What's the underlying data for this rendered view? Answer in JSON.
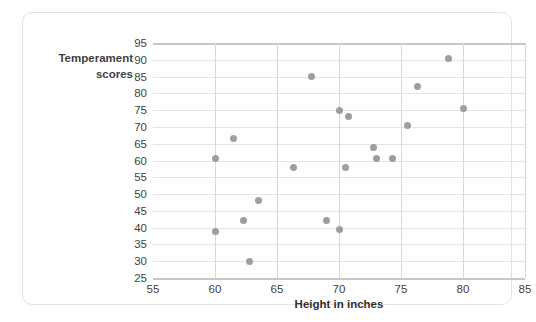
{
  "chart_data": {
    "type": "scatter",
    "title": "",
    "xlabel": "Height in inches",
    "ylabel": "Temperament scores",
    "ylabel_line1": "Temperament",
    "ylabel_line2": "scores",
    "xlim": [
      55,
      85
    ],
    "ylim": [
      25,
      95
    ],
    "xticks": [
      55,
      60,
      65,
      70,
      75,
      80,
      85
    ],
    "yticks": [
      25,
      30,
      35,
      40,
      45,
      50,
      55,
      60,
      65,
      70,
      75,
      80,
      85,
      90,
      95
    ],
    "grid": true,
    "legend": "none",
    "marker_color": "#9e9e9e",
    "gridline_color": "#e4e4e4",
    "axis_color": "#c7c7c7",
    "points": [
      {
        "x": 60.0,
        "y": 60.5
      },
      {
        "x": 60.0,
        "y": 39.0
      },
      {
        "x": 61.5,
        "y": 66.5
      },
      {
        "x": 62.3,
        "y": 42.0
      },
      {
        "x": 62.8,
        "y": 30.0
      },
      {
        "x": 63.5,
        "y": 48.0
      },
      {
        "x": 66.3,
        "y": 58.0
      },
      {
        "x": 67.8,
        "y": 85.0
      },
      {
        "x": 69.0,
        "y": 42.0
      },
      {
        "x": 70.0,
        "y": 75.0
      },
      {
        "x": 70.0,
        "y": 39.5
      },
      {
        "x": 70.8,
        "y": 73.0
      },
      {
        "x": 70.5,
        "y": 58.0
      },
      {
        "x": 72.8,
        "y": 64.0
      },
      {
        "x": 73.0,
        "y": 60.5
      },
      {
        "x": 74.3,
        "y": 60.5
      },
      {
        "x": 75.5,
        "y": 70.5
      },
      {
        "x": 76.3,
        "y": 82.0
      },
      {
        "x": 78.8,
        "y": 90.5
      },
      {
        "x": 80.0,
        "y": 75.5
      }
    ]
  }
}
